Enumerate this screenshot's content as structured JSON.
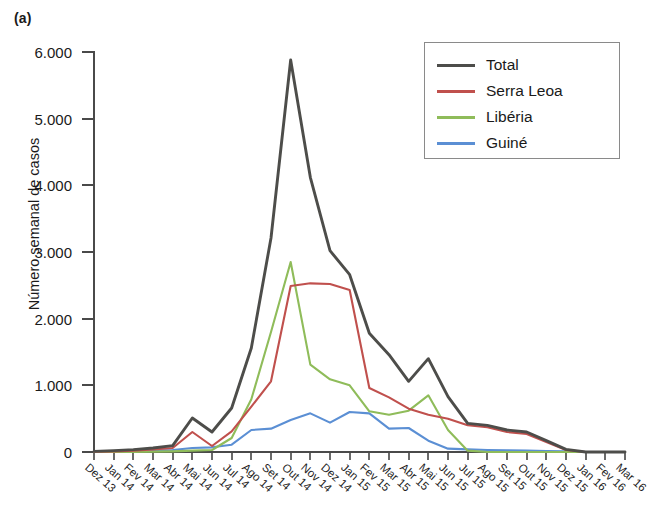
{
  "panel": {
    "label": "(a)"
  },
  "axes": {
    "ylabel": "Número semanal de casos",
    "ytick_labels": [
      "0",
      "1.000",
      "2.000",
      "3.000",
      "4.000",
      "5.000",
      "6.000"
    ],
    "xtick_labels": [
      "Dez 13",
      "Jan 14",
      "Fev 14",
      "Mar 14",
      "Abr 14",
      "Mai 14",
      "Jun 14",
      "Jul 14",
      "Ago 14",
      "Set 14",
      "Out 14",
      "Nov 14",
      "Dez 14",
      "Jan 15",
      "Fev 15",
      "Mar 15",
      "Abr 15",
      "Mai 15",
      "Jun 15",
      "Jul 15",
      "Ago 15",
      "Set 15",
      "Out 15",
      "Nov 15",
      "Dez 15",
      "Jan 16",
      "Fev 16",
      "Mar 16"
    ]
  },
  "legend": {
    "position": "top-right",
    "entries": [
      {
        "label": "Total",
        "color": "#4d4d4a"
      },
      {
        "label": "Serra Leoa",
        "color": "#c0504d"
      },
      {
        "label": "Libéria",
        "color": "#8fbc5a"
      },
      {
        "label": "Guiné",
        "color": "#5b8fd4"
      }
    ]
  },
  "chart_data": {
    "type": "line",
    "title": "",
    "xlabel": "",
    "ylabel": "Número semanal de casos",
    "xlim": [
      0,
      27
    ],
    "ylim": [
      0,
      6000
    ],
    "yticks": [
      0,
      1000,
      2000,
      3000,
      4000,
      5000,
      6000
    ],
    "grid": false,
    "legend_position": "top-right",
    "x": [
      "Dez 13",
      "Jan 14",
      "Fev 14",
      "Mar 14",
      "Abr 14",
      "Mai 14",
      "Jun 14",
      "Jul 14",
      "Ago 14",
      "Set 14",
      "Out 14",
      "Nov 14",
      "Dez 14",
      "Jan 15",
      "Fev 15",
      "Mar 15",
      "Abr 15",
      "Mai 15",
      "Jun 15",
      "Jul 15",
      "Ago 15",
      "Set 15",
      "Out 15",
      "Nov 15",
      "Dez 15",
      "Jan 16",
      "Fev 16",
      "Mar 16"
    ],
    "series": [
      {
        "name": "Total",
        "color": "#4d4d4a",
        "values": [
          10,
          20,
          35,
          60,
          95,
          510,
          300,
          660,
          1560,
          3210,
          5880,
          4120,
          3020,
          2660,
          1780,
          1460,
          1060,
          1400,
          830,
          430,
          400,
          330,
          300,
          170,
          40,
          0,
          0,
          0
        ]
      },
      {
        "name": "Serra Leoa",
        "color": "#c0504d",
        "values": [
          5,
          10,
          20,
          40,
          60,
          300,
          90,
          310,
          680,
          1060,
          2490,
          2530,
          2520,
          2430,
          960,
          820,
          650,
          560,
          500,
          400,
          370,
          300,
          270,
          150,
          30,
          0,
          0,
          0
        ]
      },
      {
        "name": "Libéria",
        "color": "#8fbc5a",
        "values": [
          0,
          0,
          0,
          5,
          10,
          20,
          30,
          210,
          790,
          1800,
          2850,
          1310,
          1090,
          1000,
          610,
          560,
          620,
          850,
          330,
          20,
          0,
          0,
          0,
          0,
          0,
          0,
          0,
          0
        ]
      },
      {
        "name": "Guiné",
        "color": "#5b8fd4",
        "values": [
          5,
          10,
          15,
          25,
          30,
          60,
          70,
          110,
          330,
          350,
          480,
          580,
          440,
          600,
          580,
          350,
          360,
          170,
          50,
          40,
          30,
          25,
          20,
          15,
          10,
          0,
          0,
          0
        ]
      }
    ]
  }
}
